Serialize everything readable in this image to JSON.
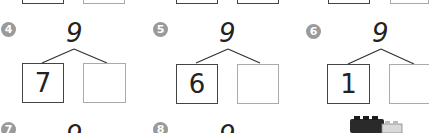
{
  "problems": [
    {
      "number": "4",
      "whole": "9",
      "part_left": "7",
      "part_right": ""
    },
    {
      "number": "5",
      "whole": "9",
      "part_left": "6",
      "part_right": ""
    },
    {
      "number": "6",
      "whole": "9",
      "part_left": "1",
      "part_right": ""
    },
    {
      "number": "7",
      "whole": "9"
    },
    {
      "number": "8",
      "whole": "9"
    }
  ],
  "colors": {
    "badge": "#9a9a9a",
    "ink": "#222222",
    "empty_box": "#aaaaaa"
  }
}
